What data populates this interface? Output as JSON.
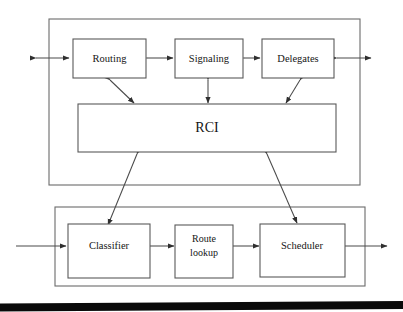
{
  "diagram": {
    "background_color": "#ffffff",
    "line_color": "#4a4a4a",
    "box_stroke_color": "#595959",
    "text_color": "#151515",
    "containers": [
      {
        "id": "control-plane",
        "label": ""
      },
      {
        "id": "forwarding-plane",
        "label": ""
      }
    ],
    "blocks": {
      "routing": "Routing",
      "signaling": "Signaling",
      "delegates": "Delegates",
      "rci": "RCI",
      "classifier": "Classifier",
      "route_lookup_line1": "Route",
      "route_lookup_line2": "lookup",
      "scheduler": "Scheduler"
    },
    "connections": [
      {
        "from": "external-left",
        "to": "routing",
        "style": "double-arrow"
      },
      {
        "from": "routing",
        "to": "signaling",
        "style": "double-arrow"
      },
      {
        "from": "signaling",
        "to": "delegates",
        "style": "double-arrow"
      },
      {
        "from": "delegates",
        "to": "external-right",
        "style": "double-arrow"
      },
      {
        "from": "routing",
        "to": "rci",
        "style": "double-arrow"
      },
      {
        "from": "signaling",
        "to": "rci",
        "style": "double-arrow"
      },
      {
        "from": "delegates",
        "to": "rci",
        "style": "double-arrow"
      },
      {
        "from": "rci",
        "to": "classifier",
        "style": "double-arrow"
      },
      {
        "from": "rci",
        "to": "scheduler",
        "style": "double-arrow"
      },
      {
        "from": "packet-in",
        "to": "classifier",
        "style": "arrow"
      },
      {
        "from": "classifier",
        "to": "route-lookup",
        "style": "arrow"
      },
      {
        "from": "route-lookup",
        "to": "scheduler",
        "style": "arrow"
      },
      {
        "from": "scheduler",
        "to": "packet-out",
        "style": "arrow"
      }
    ]
  }
}
